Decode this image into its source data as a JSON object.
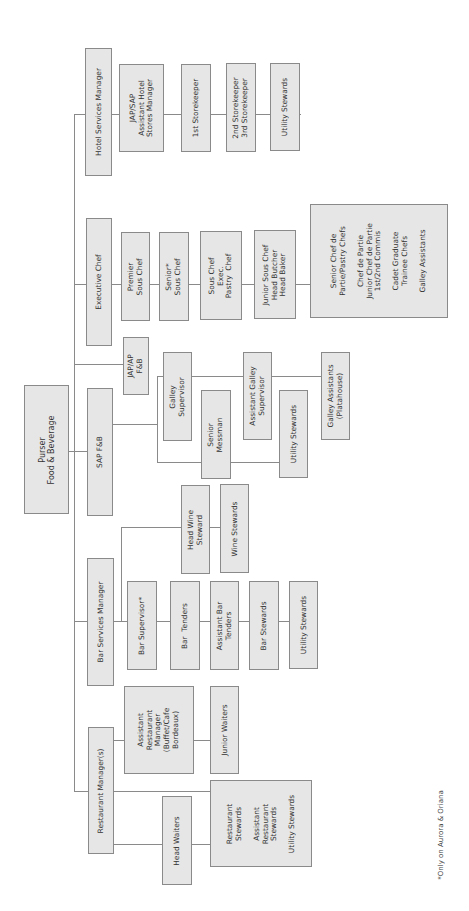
{
  "chart": {
    "root": {
      "label": "Purser\nFood & Beverage"
    },
    "branches": {
      "hotel_services": {
        "head": "Hotel Services Manager",
        "chain": [
          "JAP/SAP\nAssistant Hotel\nStores Manager",
          "1st Storekeeper",
          "2nd Storekeeper\n3rd Storekeeper",
          "Utility Stewards"
        ]
      },
      "executive_chef": {
        "head": "Executive Chef",
        "chain": [
          "Premier\nSous Chef",
          "Senior*\nSous Chef",
          "Sous Chef\nExec.\nPastry  Chef",
          "Junior Sous Chef\nHead Butcher\nHead Baker",
          "Senior Chef de\nPartie/Pastry Chefs\n\nChef de Partie\nJunior Chef de Partie\n1st/2nd Commis\n\nCadet Graduate\nTrainee Chefs\n\nGalley Assistants"
        ]
      },
      "jap_ap_fb": {
        "head": "JAP/AP\nF&B"
      },
      "sap_fb": {
        "head": "SAP F&B",
        "galley_line": [
          "Galley\nSupervisor",
          "Assistant Galley\nSupervisor",
          "Galley Assistants\n(Platahouse)"
        ],
        "messman_line": [
          "Senior\nMessman",
          "Utility Stewards"
        ]
      },
      "bar_services": {
        "head": "Bar Services Manager",
        "wine_line": [
          "Head Wine\nSteward",
          "Wine Stewards"
        ],
        "bar_line": [
          "Bar Supervisor*",
          "Bar  Tenders",
          "Assistant Bar\nTenders",
          "Bar Stewards",
          "Utility Stewards"
        ]
      },
      "restaurant": {
        "head": "Restaurant Manager(s)",
        "assistant_line": [
          "Assistant\nRestaurant\nManager\n(Buffet/Cafe\nBordeaux)",
          "Junior Waiters"
        ],
        "waiters_line": [
          "Head Waiters",
          "Restaurant\nStewards\n\nAssistant\nRestaurant\nStewards\n\nUtility Stewards"
        ]
      }
    },
    "footnote": "*Only on Aurora & Oriana"
  },
  "colors": {
    "box_fill": "#e6e6e6",
    "box_border": "#8a8a8a",
    "line": "#8a8a8a"
  }
}
